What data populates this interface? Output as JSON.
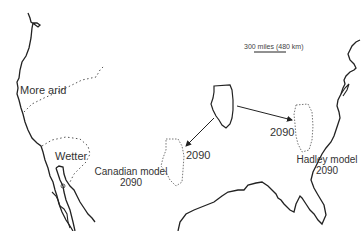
{
  "map": {
    "scale_bar": {
      "label": "300 miles (480 km)"
    },
    "regions": {
      "more_arid": "More arid",
      "wetter": "Wetter"
    },
    "projections": {
      "canadian": {
        "model": "Canadian model",
        "year": "2090",
        "arrow_year": "2090"
      },
      "hadley": {
        "model": "Hadley model",
        "year": "2090",
        "arrow_year": "2090"
      }
    },
    "colors": {
      "coastline": "#222222",
      "dotted": "#555555",
      "projected_outline": "#777777"
    }
  }
}
